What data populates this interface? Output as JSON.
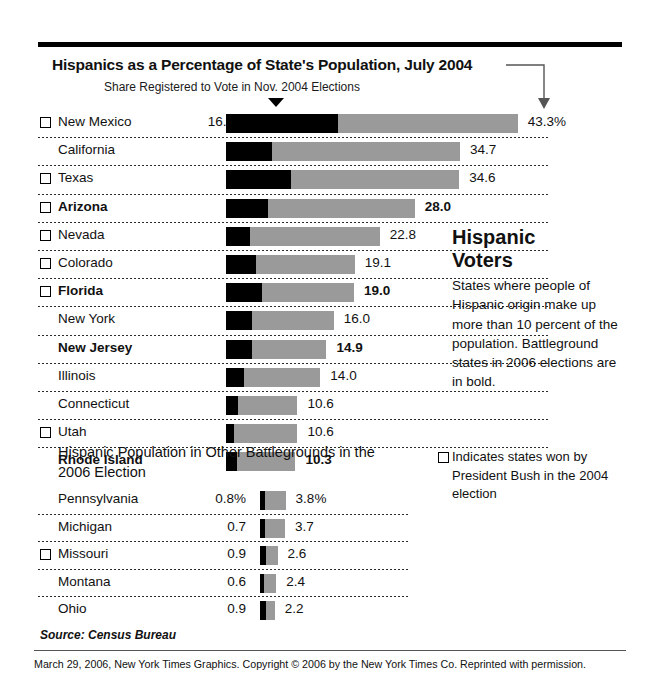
{
  "chart_data": {
    "type": "bar",
    "title": "Hispanics as a Percentage of State's Population, July 2004",
    "subtitle": "Share Registered to Vote in Nov. 2004 Elections",
    "xlabel": "",
    "ylabel": "",
    "orientation": "horizontal",
    "stacked_overlay": true,
    "xlim": [
      0,
      43.3
    ],
    "grid": false,
    "legend_position": "right",
    "series": [
      {
        "name": "Share Registered to Vote in Nov. 2004 Elections",
        "color": "#000000"
      },
      {
        "name": "Hispanics as a Percentage of State's Population, July 2004",
        "color": "#9a9a9a"
      }
    ],
    "categories": [
      "New Mexico",
      "California",
      "Texas",
      "Arizona",
      "Nevada",
      "Colorado",
      "Florida",
      "New York",
      "New Jersey",
      "Illinois",
      "Connecticut",
      "Utah",
      "Rhode Island"
    ],
    "registered_share": [
      16.6,
      6.8,
      9.6,
      6.2,
      3.6,
      4.4,
      5.3,
      3.9,
      3.8,
      2.7,
      1.8,
      1.2,
      1.6
    ],
    "population_pct": [
      43.3,
      34.7,
      34.6,
      28.0,
      22.8,
      19.1,
      19.0,
      16.0,
      14.9,
      14.0,
      10.6,
      10.6,
      10.3
    ],
    "secondary_categories": [
      "Pennsylvania",
      "Michigan",
      "Missouri",
      "Montana",
      "Ohio"
    ],
    "secondary_registered_share": [
      0.8,
      0.7,
      0.9,
      0.6,
      0.9
    ],
    "secondary_population_pct": [
      3.8,
      3.7,
      2.6,
      2.4,
      2.2
    ],
    "annotations": [
      "Battleground states in 2006 elections are in bold.",
      "Square indicates states won by President Bush in the 2004 election"
    ]
  },
  "header": {
    "title": "Hispanics as a Percentage of State's Population, July 2004",
    "subtitle": "Share Registered to Vote in Nov. 2004 Elections"
  },
  "main_table": {
    "rows": [
      {
        "state": "New Mexico",
        "share": "16.6%",
        "total": "43.3%",
        "share_val": 16.6,
        "total_val": 43.3,
        "bush": true,
        "bold": false
      },
      {
        "state": "California",
        "share": "6.8",
        "total": "34.7",
        "share_val": 6.8,
        "total_val": 34.7,
        "bush": false,
        "bold": false
      },
      {
        "state": "Texas",
        "share": "9.6",
        "total": "34.6",
        "share_val": 9.6,
        "total_val": 34.6,
        "bush": true,
        "bold": false
      },
      {
        "state": "Arizona",
        "share": "6.2",
        "total": "28.0",
        "share_val": 6.2,
        "total_val": 28.0,
        "bush": true,
        "bold": true
      },
      {
        "state": "Nevada",
        "share": "3.6",
        "total": "22.8",
        "share_val": 3.6,
        "total_val": 22.8,
        "bush": true,
        "bold": false
      },
      {
        "state": "Colorado",
        "share": "4.4",
        "total": "19.1",
        "share_val": 4.4,
        "total_val": 19.1,
        "bush": true,
        "bold": false
      },
      {
        "state": "Florida",
        "share": "5.3",
        "total": "19.0",
        "share_val": 5.3,
        "total_val": 19.0,
        "bush": true,
        "bold": true
      },
      {
        "state": "New York",
        "share": "3.9",
        "total": "16.0",
        "share_val": 3.9,
        "total_val": 16.0,
        "bush": false,
        "bold": false
      },
      {
        "state": "New Jersey",
        "share": "3.8",
        "total": "14.9",
        "share_val": 3.8,
        "total_val": 14.9,
        "bush": false,
        "bold": true
      },
      {
        "state": "Illinois",
        "share": "2.7",
        "total": "14.0",
        "share_val": 2.7,
        "total_val": 14.0,
        "bush": false,
        "bold": false
      },
      {
        "state": "Connecticut",
        "share": "1.8",
        "total": "10.6",
        "share_val": 1.8,
        "total_val": 10.6,
        "bush": false,
        "bold": false
      },
      {
        "state": "Utah",
        "share": "1.2",
        "total": "10.6",
        "share_val": 1.2,
        "total_val": 10.6,
        "bush": true,
        "bold": false
      },
      {
        "state": "Rhode Island",
        "share": "1.6",
        "total": "10.3",
        "share_val": 1.6,
        "total_val": 10.3,
        "bush": false,
        "bold": true
      }
    ]
  },
  "secondary_table": {
    "heading": "Hispanic Population in Other Battlegrounds in the 2006 Election",
    "rows": [
      {
        "state": "Pennsylvania",
        "share": "0.8%",
        "total": "3.8%",
        "share_val": 0.8,
        "total_val": 3.8,
        "bush": false
      },
      {
        "state": "Michigan",
        "share": "0.7",
        "total": "3.7",
        "share_val": 0.7,
        "total_val": 3.7,
        "bush": false
      },
      {
        "state": "Missouri",
        "share": "0.9",
        "total": "2.6",
        "share_val": 0.9,
        "total_val": 2.6,
        "bush": true
      },
      {
        "state": "Montana",
        "share": "0.6",
        "total": "2.4",
        "share_val": 0.6,
        "total_val": 2.4,
        "bush": false
      },
      {
        "state": "Ohio",
        "share": "0.9",
        "total": "2.2",
        "share_val": 0.9,
        "total_val": 2.2,
        "bush": false
      }
    ]
  },
  "side_panel": {
    "heading_line1": "Hispanic",
    "heading_line2": "Voters",
    "body": "States where people of Hispanic origin make up more than 10 percent of the population. Battleground states in 2006 elections are in bold.",
    "legend": "Indicates states won by President Bush in the 2004 election"
  },
  "footer": {
    "source": "Source: Census Bureau",
    "credit": "March 29, 2006, New York Times Graphics. Copyright © 2006 by the New York Times Co. Reprinted with permission."
  },
  "colors": {
    "bar_registered": "#000000",
    "bar_population": "#9a9a9a",
    "rule": "#000000"
  }
}
